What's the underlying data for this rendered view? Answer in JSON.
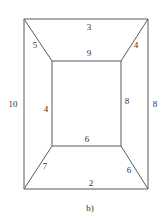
{
  "figure": {
    "caption": "b)",
    "colors": {
      "edge": "#5a5a5a",
      "label": "#333333",
      "background": "#ffffff"
    }
  },
  "nodes": {
    "outer_top_left": {
      "x": 24,
      "y": 19
    },
    "outer_top_right": {
      "x": 148,
      "y": 19
    },
    "outer_bottom_left": {
      "x": 24,
      "y": 189
    },
    "outer_bottom_right": {
      "x": 148,
      "y": 189
    },
    "inner_top_left": {
      "x": 52,
      "y": 61
    },
    "inner_top_right": {
      "x": 121,
      "y": 61
    },
    "inner_bottom_left": {
      "x": 52,
      "y": 146
    },
    "inner_bottom_right": {
      "x": 121,
      "y": 146
    }
  },
  "edges": {
    "outer_top": {
      "label": "3",
      "from": "outer_top_left",
      "to": "outer_top_right",
      "lx": 89,
      "ly": 30
    },
    "inner_top": {
      "label": "9",
      "from": "inner_top_left",
      "to": "inner_top_right",
      "lx": 89,
      "ly": 56
    },
    "diag_top_left": {
      "label": "5",
      "from": "outer_top_left",
      "to": "inner_top_left",
      "lx": 35,
      "ly": 48
    },
    "diag_top_right": {
      "label": "4",
      "from": "outer_top_right",
      "to": "inner_top_right",
      "lx": 136,
      "ly": 48
    },
    "outer_left": {
      "label": "10",
      "from": "outer_top_left",
      "to": "outer_bottom_left",
      "lx": 13,
      "ly": 107
    },
    "inner_left": {
      "label": "4",
      "from": "inner_top_left",
      "to": "inner_bottom_left",
      "lx": 46,
      "ly": 112
    },
    "inner_right": {
      "label": "8",
      "from": "inner_top_right",
      "to": "inner_bottom_right",
      "lx": 127,
      "ly": 104
    },
    "outer_right": {
      "label": "8",
      "from": "outer_top_right",
      "to": "outer_bottom_right",
      "lx": 155,
      "ly": 107
    },
    "inner_bottom": {
      "label": "6",
      "from": "inner_bottom_left",
      "to": "inner_bottom_right",
      "lx": 87,
      "ly": 142
    },
    "diag_bottom_left": {
      "label": "7",
      "from": "outer_bottom_left",
      "to": "inner_bottom_left",
      "lx": 45,
      "ly": 169
    },
    "diag_bottom_right": {
      "label": "6",
      "from": "outer_bottom_right",
      "to": "inner_bottom_right",
      "lx": 129,
      "ly": 173
    },
    "outer_bottom": {
      "label": "2",
      "from": "outer_bottom_left",
      "to": "outer_bottom_right",
      "lx": 91,
      "ly": 186
    }
  }
}
